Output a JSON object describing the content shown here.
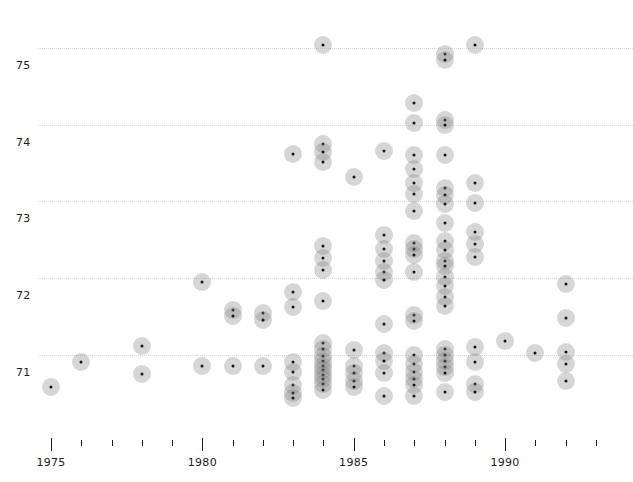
{
  "chart_data": {
    "type": "scatter",
    "title": "",
    "xlabel": "",
    "ylabel": "",
    "grid": true,
    "legend": null,
    "xlim": [
      1974.2,
      1993.2
    ],
    "ylim": [
      70.4,
      75.35
    ],
    "x_ticks_major": [
      1975,
      1980,
      1985,
      1990
    ],
    "x_tick_labels": [
      "1975",
      "1980",
      "1985",
      "1990"
    ],
    "x_ticks_minor": [
      1976,
      1977,
      1978,
      1979,
      1981,
      1982,
      1983,
      1984,
      1986,
      1987,
      1988,
      1989,
      1991,
      1992,
      1993
    ],
    "y_ticks": [
      71,
      72,
      73,
      74,
      75
    ],
    "y_tick_labels": [
      "71",
      "72",
      "73",
      "74",
      "75"
    ],
    "marker": {
      "shape": "circle",
      "face_color": "#828282",
      "face_alpha": 0.33,
      "center_dot_color": "#161616",
      "diameter_px": 18
    },
    "points": [
      {
        "x": 1975,
        "y": 70.58
      },
      {
        "x": 1976,
        "y": 70.9
      },
      {
        "x": 1978,
        "y": 71.12
      },
      {
        "x": 1978,
        "y": 70.75
      },
      {
        "x": 1980,
        "y": 71.95
      },
      {
        "x": 1980,
        "y": 70.85
      },
      {
        "x": 1981,
        "y": 71.58
      },
      {
        "x": 1981,
        "y": 71.5
      },
      {
        "x": 1981,
        "y": 70.85
      },
      {
        "x": 1982,
        "y": 71.55
      },
      {
        "x": 1982,
        "y": 71.45
      },
      {
        "x": 1982,
        "y": 70.85
      },
      {
        "x": 1983,
        "y": 73.62
      },
      {
        "x": 1983,
        "y": 71.82
      },
      {
        "x": 1983,
        "y": 71.62
      },
      {
        "x": 1983,
        "y": 70.9
      },
      {
        "x": 1983,
        "y": 70.78
      },
      {
        "x": 1983,
        "y": 70.6
      },
      {
        "x": 1983,
        "y": 70.5
      },
      {
        "x": 1983,
        "y": 70.44
      },
      {
        "x": 1984,
        "y": 75.04
      },
      {
        "x": 1984,
        "y": 73.75
      },
      {
        "x": 1984,
        "y": 73.65
      },
      {
        "x": 1984,
        "y": 73.52
      },
      {
        "x": 1984,
        "y": 72.42
      },
      {
        "x": 1984,
        "y": 72.26
      },
      {
        "x": 1984,
        "y": 72.1
      },
      {
        "x": 1984,
        "y": 71.7
      },
      {
        "x": 1984,
        "y": 71.16
      },
      {
        "x": 1984,
        "y": 71.08
      },
      {
        "x": 1984,
        "y": 70.98
      },
      {
        "x": 1984,
        "y": 70.92
      },
      {
        "x": 1984,
        "y": 70.86
      },
      {
        "x": 1984,
        "y": 70.8
      },
      {
        "x": 1984,
        "y": 70.74
      },
      {
        "x": 1984,
        "y": 70.68
      },
      {
        "x": 1984,
        "y": 70.62
      },
      {
        "x": 1984,
        "y": 70.54
      },
      {
        "x": 1985,
        "y": 73.32
      },
      {
        "x": 1985,
        "y": 71.06
      },
      {
        "x": 1985,
        "y": 70.86
      },
      {
        "x": 1985,
        "y": 70.76
      },
      {
        "x": 1985,
        "y": 70.66
      },
      {
        "x": 1985,
        "y": 70.58
      },
      {
        "x": 1986,
        "y": 73.66
      },
      {
        "x": 1986,
        "y": 72.56
      },
      {
        "x": 1986,
        "y": 72.38
      },
      {
        "x": 1986,
        "y": 72.22
      },
      {
        "x": 1986,
        "y": 72.08
      },
      {
        "x": 1986,
        "y": 71.98
      },
      {
        "x": 1986,
        "y": 71.4
      },
      {
        "x": 1986,
        "y": 71.02
      },
      {
        "x": 1986,
        "y": 70.92
      },
      {
        "x": 1986,
        "y": 70.76
      },
      {
        "x": 1986,
        "y": 70.46
      },
      {
        "x": 1987,
        "y": 74.28
      },
      {
        "x": 1987,
        "y": 74.02
      },
      {
        "x": 1987,
        "y": 73.6
      },
      {
        "x": 1987,
        "y": 73.42
      },
      {
        "x": 1987,
        "y": 73.24
      },
      {
        "x": 1987,
        "y": 73.1
      },
      {
        "x": 1987,
        "y": 72.88
      },
      {
        "x": 1987,
        "y": 72.46
      },
      {
        "x": 1987,
        "y": 72.38
      },
      {
        "x": 1987,
        "y": 72.3
      },
      {
        "x": 1987,
        "y": 72.08
      },
      {
        "x": 1987,
        "y": 71.52
      },
      {
        "x": 1987,
        "y": 71.44
      },
      {
        "x": 1987,
        "y": 71.0
      },
      {
        "x": 1987,
        "y": 70.88
      },
      {
        "x": 1987,
        "y": 70.78
      },
      {
        "x": 1987,
        "y": 70.68
      },
      {
        "x": 1987,
        "y": 70.6
      },
      {
        "x": 1987,
        "y": 70.46
      },
      {
        "x": 1988,
        "y": 74.92
      },
      {
        "x": 1988,
        "y": 74.84
      },
      {
        "x": 1988,
        "y": 74.06
      },
      {
        "x": 1988,
        "y": 74.0
      },
      {
        "x": 1988,
        "y": 73.6
      },
      {
        "x": 1988,
        "y": 73.18
      },
      {
        "x": 1988,
        "y": 73.08
      },
      {
        "x": 1988,
        "y": 72.96
      },
      {
        "x": 1988,
        "y": 72.72
      },
      {
        "x": 1988,
        "y": 72.48
      },
      {
        "x": 1988,
        "y": 72.36
      },
      {
        "x": 1988,
        "y": 72.22
      },
      {
        "x": 1988,
        "y": 72.16
      },
      {
        "x": 1988,
        "y": 72.02
      },
      {
        "x": 1988,
        "y": 71.9
      },
      {
        "x": 1988,
        "y": 71.76
      },
      {
        "x": 1988,
        "y": 71.64
      },
      {
        "x": 1988,
        "y": 71.08
      },
      {
        "x": 1988,
        "y": 71.0
      },
      {
        "x": 1988,
        "y": 70.92
      },
      {
        "x": 1988,
        "y": 70.84
      },
      {
        "x": 1988,
        "y": 70.76
      },
      {
        "x": 1988,
        "y": 70.52
      },
      {
        "x": 1989,
        "y": 75.04
      },
      {
        "x": 1989,
        "y": 73.24
      },
      {
        "x": 1989,
        "y": 72.98
      },
      {
        "x": 1989,
        "y": 72.6
      },
      {
        "x": 1989,
        "y": 72.44
      },
      {
        "x": 1989,
        "y": 72.28
      },
      {
        "x": 1989,
        "y": 71.1
      },
      {
        "x": 1989,
        "y": 70.9
      },
      {
        "x": 1989,
        "y": 70.62
      },
      {
        "x": 1989,
        "y": 70.52
      },
      {
        "x": 1990,
        "y": 71.18
      },
      {
        "x": 1991,
        "y": 71.02
      },
      {
        "x": 1992,
        "y": 71.92
      },
      {
        "x": 1992,
        "y": 71.48
      },
      {
        "x": 1992,
        "y": 71.04
      },
      {
        "x": 1992,
        "y": 70.88
      },
      {
        "x": 1992,
        "y": 70.66
      }
    ]
  },
  "axis": {
    "y_axis_title": "",
    "x_axis_title": ""
  }
}
